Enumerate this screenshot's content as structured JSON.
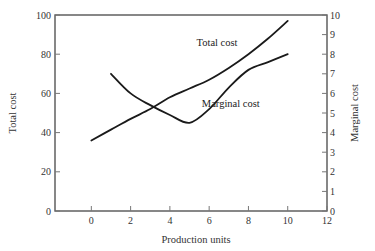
{
  "chart_data": {
    "type": "line",
    "title": "",
    "xlabel": "Production units",
    "ylabel": "Total cost",
    "y2label": "Marginal cost",
    "xlim": [
      -1.85,
      12
    ],
    "ylim": [
      0,
      100
    ],
    "y2lim": [
      0,
      10
    ],
    "x_ticks": [
      0,
      2,
      4,
      6,
      8,
      10,
      12
    ],
    "y_ticks": [
      0,
      20,
      40,
      60,
      80,
      100
    ],
    "y2_ticks": [
      0,
      1,
      2,
      3,
      4,
      5,
      6,
      7,
      8,
      9,
      10
    ],
    "grid": false,
    "legend": "none (inline annotations)",
    "series": [
      {
        "name": "Total cost",
        "axis": "left",
        "x": [
          0,
          1,
          2,
          3,
          4,
          5,
          6,
          7,
          8,
          9,
          10
        ],
        "values": [
          36,
          41.5,
          47,
          52,
          58,
          62.5,
          67,
          73,
          80,
          88,
          97
        ]
      },
      {
        "name": "Marginal cost",
        "axis": "right",
        "x": [
          1,
          2,
          3,
          4,
          5,
          6,
          7,
          8,
          9,
          10
        ],
        "values": [
          7.0,
          6.0,
          5.4,
          4.9,
          4.5,
          5.2,
          6.3,
          7.2,
          7.6,
          8.0
        ]
      }
    ],
    "annotations": [
      {
        "text": "Total cost",
        "x": 6.4,
        "y": 84
      },
      {
        "text": "Marginal cost",
        "x": 7.1,
        "y": 53
      }
    ]
  }
}
